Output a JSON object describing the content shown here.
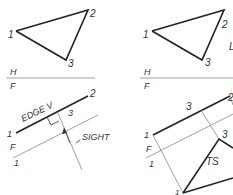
{
  "left_top": {
    "points": {
      "p1": "1",
      "p2": "2",
      "p3": "3"
    },
    "fold_top": "H",
    "fold_bottom": "F"
  },
  "right_top": {
    "points": {
      "p1": "1",
      "p2": "2",
      "p3": "3"
    },
    "fold_top": "H",
    "fold_bottom": "F",
    "partial": "L"
  },
  "left_bottom": {
    "edge_label": "EDGE V",
    "p1": "1",
    "p2": "2",
    "p3": "3",
    "fold_top": "F",
    "fold_bottom": "1",
    "sight_label": "SIGHT"
  },
  "right_bottom": {
    "p1": "1",
    "p2": "2",
    "p3_top": "3",
    "p3_tv": "3",
    "fold_top": "F",
    "fold_bottom": "1",
    "ts_label": "TS",
    "p1_tv": "1"
  }
}
